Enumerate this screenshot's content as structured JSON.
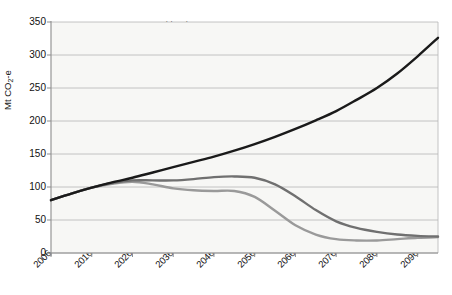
{
  "chart_data": {
    "type": "line",
    "title": "",
    "xlabel": "",
    "ylabel": "Mt CO2-e",
    "ylabel_main": "Mt CO",
    "ylabel_sub": "2",
    "ylabel_suffix": "-e",
    "xlim": [
      2006,
      2101
    ],
    "ylim": [
      0,
      350
    ],
    "grid": true,
    "legend_position": "top-center",
    "ytick_labels": [
      "0",
      "50",
      "100",
      "150",
      "200",
      "250",
      "300",
      "350"
    ],
    "ytick_values": [
      0,
      50,
      100,
      150,
      200,
      250,
      300,
      350
    ],
    "xtick_labels": [
      "2006",
      "2016",
      "2026",
      "2036",
      "2046",
      "2056",
      "2066",
      "2076",
      "2086",
      "2096"
    ],
    "xtick_values": [
      2006,
      2016,
      2026,
      2036,
      2046,
      2056,
      2066,
      2076,
      2086,
      2096
    ],
    "series": [
      {
        "name": "No mitigation",
        "color": "#1a1a1a",
        "x": [
          2006,
          2011,
          2016,
          2021,
          2026,
          2031,
          2036,
          2041,
          2046,
          2051,
          2056,
          2061,
          2066,
          2071,
          2076,
          2081,
          2086,
          2091,
          2096,
          2101
        ],
        "values": [
          80,
          90,
          99,
          107,
          114,
          122,
          130,
          138,
          146,
          155,
          165,
          176,
          188,
          201,
          215,
          232,
          250,
          272,
          298,
          326
        ]
      },
      {
        "name": "550",
        "color": "#707070",
        "x": [
          2006,
          2011,
          2016,
          2021,
          2026,
          2031,
          2036,
          2041,
          2046,
          2051,
          2056,
          2061,
          2066,
          2071,
          2076,
          2081,
          2086,
          2091,
          2096,
          2101
        ],
        "values": [
          80,
          90,
          99,
          106,
          110,
          110,
          110,
          112,
          115,
          116,
          114,
          104,
          86,
          65,
          48,
          38,
          32,
          28,
          26,
          25
        ]
      },
      {
        "name": "450",
        "color": "#9a9a9a",
        "x": [
          2006,
          2011,
          2016,
          2021,
          2026,
          2031,
          2036,
          2041,
          2046,
          2051,
          2056,
          2061,
          2066,
          2071,
          2076,
          2081,
          2086,
          2091,
          2096,
          2101
        ],
        "values": [
          80,
          90,
          99,
          105,
          108,
          104,
          98,
          95,
          94,
          94,
          85,
          64,
          42,
          28,
          21,
          19,
          19,
          21,
          23,
          24
        ]
      }
    ]
  },
  "legend": {
    "items": [
      {
        "label": "No mitigation",
        "color": "#1a1a1a"
      },
      {
        "label": "550",
        "color": "#707070"
      },
      {
        "label": "450",
        "color": "#9a9a9a"
      }
    ]
  },
  "axes": {
    "y_label_text": "Mt CO2-e"
  }
}
